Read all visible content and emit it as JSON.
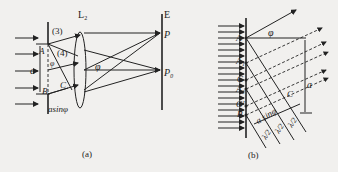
{
  "figure_a": {
    "caption": "(a)",
    "labels": {
      "lens": "L₂",
      "screen": "E",
      "point_p": "P",
      "point_p0": "P₀",
      "ray3": "(3)",
      "ray4": "(4)",
      "edge_a": "A",
      "edge_b": "B",
      "point_c": "C",
      "width": "a",
      "angle": "φ",
      "angle_at_a": "φ",
      "path_diff": "asinφ"
    }
  },
  "figure_b": {
    "caption": "(b)",
    "labels": {
      "angle": "φ",
      "a": "A",
      "a1": "A₁",
      "g": "G",
      "a2": "A₂",
      "g_prime": "G′",
      "b": "B",
      "c": "C",
      "width": "a",
      "path_diff": "a sinφ",
      "half_wave": "λ/2",
      "half_wave_num": "λ",
      "half_wave_den": "2"
    }
  },
  "colors": {
    "ink": "#222222",
    "paper": "#f1f0ee"
  }
}
